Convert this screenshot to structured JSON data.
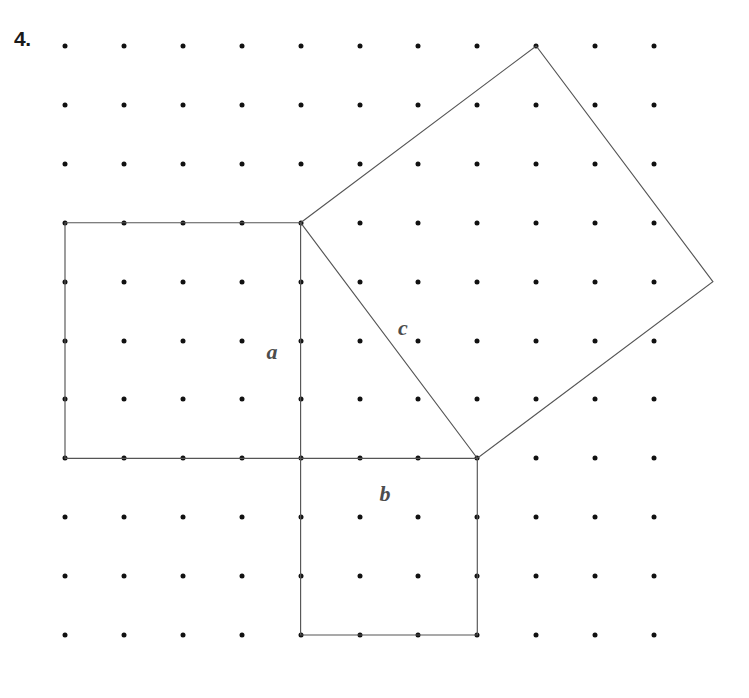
{
  "page": {
    "problem_number": "4.",
    "background_color": "#ffffff",
    "width": 749,
    "height": 698
  },
  "grid": {
    "name": "dot-lattice",
    "origin_x": 65,
    "origin_y": 46,
    "spacing": 58.9,
    "columns": 11,
    "rows": 11,
    "dot_color": "#111111",
    "dot_radius": 2.5
  },
  "figure": {
    "stroke_color": "#555555",
    "stroke_width": 1.15,
    "shapes": [
      {
        "name": "square-on-leg-a",
        "label": "a",
        "side_units": 4,
        "vertices_grid": [
          [
            0,
            3
          ],
          [
            4,
            3
          ],
          [
            4,
            7
          ],
          [
            0,
            7
          ]
        ]
      },
      {
        "name": "square-on-leg-b",
        "label": "b",
        "side_units": 3,
        "vertices_grid": [
          [
            4,
            7
          ],
          [
            7,
            7
          ],
          [
            7,
            10
          ],
          [
            4,
            10
          ]
        ]
      },
      {
        "name": "square-on-hypotenuse-c",
        "label": "c",
        "side_units": 5,
        "vertices_grid": [
          [
            4,
            3
          ],
          [
            8,
            0
          ],
          [
            11,
            4
          ],
          [
            7,
            7
          ]
        ]
      }
    ]
  },
  "labels": [
    {
      "name": "label-a",
      "text": "a",
      "x": 272,
      "y": 352,
      "color": "#4d4d4d"
    },
    {
      "name": "label-b",
      "text": "b",
      "x": 385,
      "y": 494,
      "color": "#4d4d4d"
    },
    {
      "name": "label-c",
      "text": "c",
      "x": 403,
      "y": 328,
      "color": "#4d4d4d"
    }
  ],
  "chart_data": {
    "type": "diagram",
    "triangle": {
      "legs": {
        "a": 4,
        "b": 3
      },
      "hypotenuse": {
        "c": 5
      }
    },
    "square_areas": {
      "a_squared": 16,
      "b_squared": 9,
      "c_squared": 25
    }
  }
}
